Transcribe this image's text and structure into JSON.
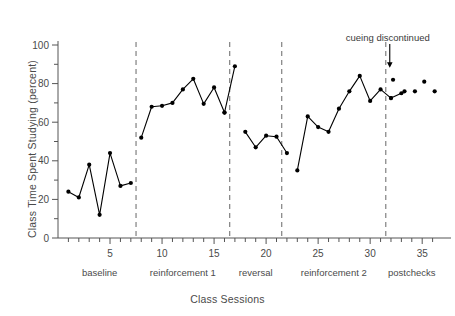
{
  "chart_data": {
    "type": "line",
    "title": "",
    "xlabel": "Class Sessions",
    "ylabel": "Class Time Spent Studying (percent)",
    "xlim": [
      0,
      37
    ],
    "ylim": [
      0,
      100
    ],
    "grid": false,
    "legend": "none",
    "y_ticks_labeled": [
      0,
      20,
      40,
      60,
      80,
      100
    ],
    "y_ticks_minor": [
      10,
      30,
      50,
      70,
      90
    ],
    "x_ticks_labeled": [
      5,
      10,
      15,
      20,
      25,
      30,
      35
    ],
    "x_tick_step_minor": 1,
    "marker": "filled-circle",
    "line_color": "#000000",
    "marker_color": "#000000",
    "divider_color": "#808080",
    "divider_style": "dashed",
    "phase_dividers": [
      7.5,
      16.5,
      21.5,
      31.5
    ],
    "phases": [
      {
        "label": "baseline",
        "start": 1,
        "end": 7
      },
      {
        "label": "reinforcement 1",
        "start": 8,
        "end": 16
      },
      {
        "label": "reversal",
        "start": 17,
        "end": 21
      },
      {
        "label": "reinforcement 2",
        "start": 22,
        "end": 31
      },
      {
        "label": "postchecks",
        "start": 32,
        "end": 36
      }
    ],
    "annotations": [
      {
        "text": "cueing discontinued",
        "x": 31.5,
        "y": 100,
        "arrow": true,
        "arrow_target_x": 31.5,
        "arrow_target_y": 88
      }
    ],
    "series": [
      {
        "name": "Class Time Spent Studying",
        "connected_segments": [
          {
            "phase": "baseline",
            "x": [
              1,
              2,
              3,
              4,
              5,
              6,
              7
            ],
            "values": [
              24,
              21,
              38,
              12,
              44,
              27,
              28.5
            ]
          },
          {
            "phase": "reinforcement 1",
            "x": [
              8,
              9,
              10,
              11,
              12,
              13,
              14,
              15,
              16
            ],
            "values": [
              52,
              68,
              68.5,
              70,
              77,
              82.5,
              69.5,
              78,
              65
            ]
          },
          {
            "phase": "reinforcement 1 end",
            "x": [
              16,
              17
            ],
            "values": [
              65,
              89
            ]
          },
          {
            "phase": "reversal",
            "x": [
              18,
              19,
              20,
              21,
              22
            ],
            "values": [
              55,
              47,
              53,
              52.5,
              44
            ]
          },
          {
            "phase": "reinforcement 2",
            "x": [
              23,
              24,
              25,
              26,
              27,
              28,
              29,
              30,
              31,
              32
            ],
            "values": [
              35,
              63,
              57.5,
              55,
              67,
              76,
              84,
              71,
              77,
              72.5
            ]
          },
          {
            "phase": "reinforcement 2 end",
            "x": [
              32,
              33
            ],
            "values": [
              72.5,
              75
            ]
          }
        ],
        "unconnected_points": [
          {
            "x": 32.2,
            "y": 82
          },
          {
            "x": 33.3,
            "y": 76
          },
          {
            "x": 34.3,
            "y": 76
          },
          {
            "x": 35.2,
            "y": 81
          },
          {
            "x": 36.2,
            "y": 76
          }
        ]
      }
    ]
  },
  "axis": {
    "y_title": "Class Time Spent Studying (percent)",
    "x_title": "Class Sessions",
    "y_tick_labels": [
      "0",
      "20",
      "40",
      "60",
      "80",
      "100"
    ],
    "x_tick_labels": [
      "5",
      "10",
      "15",
      "20",
      "25",
      "30",
      "35"
    ]
  },
  "phase_labels": [
    "baseline",
    "reinforcement 1",
    "reversal",
    "reinforcement 2",
    "postchecks"
  ],
  "annotation_label": "cueing discontinued"
}
